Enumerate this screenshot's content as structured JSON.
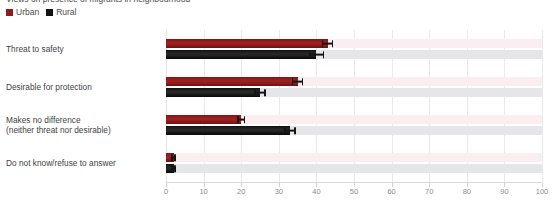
{
  "title_clipped": "Views on presence of migrants in neighbourhood",
  "legend": {
    "position": "top-left",
    "items": [
      {
        "label": "Urban",
        "color": "#8f1c1c",
        "key": "urban"
      },
      {
        "label": "Rural",
        "color": "#111111",
        "key": "rural"
      }
    ]
  },
  "chart_data": {
    "type": "bar",
    "orientation": "horizontal",
    "title": "Views on presence of migrants in neighbourhood",
    "xlabel": "",
    "ylabel": "",
    "xlim": [
      0,
      100
    ],
    "xticks": [
      0,
      10,
      20,
      30,
      40,
      50,
      60,
      70,
      80,
      90,
      100
    ],
    "xtick_labels": [
      "0",
      "10",
      "20",
      "30",
      "40",
      "50",
      "60",
      "70",
      "80",
      "90",
      "100"
    ],
    "grid": true,
    "grid_axis": "x",
    "legend_position": "top-left",
    "categories": [
      "Threat to safety",
      "Desirable for protection",
      "Makes no difference\n(neither threat nor desirable)",
      "Do not know/refuse to answer"
    ],
    "series": [
      {
        "name": "Urban",
        "color": "#8f1c1c",
        "values": [
          43,
          35,
          20,
          2
        ],
        "errors_low": [
          41.5,
          33.5,
          19,
          1.4
        ],
        "errors_high": [
          44.5,
          36.5,
          21,
          2.6
        ]
      },
      {
        "name": "Rural",
        "color": "#111111",
        "values": [
          40,
          25,
          33,
          2
        ],
        "errors_low": [
          38,
          23.5,
          31.5,
          1.4
        ],
        "errors_high": [
          42,
          26.5,
          34.5,
          2.6
        ]
      }
    ]
  }
}
